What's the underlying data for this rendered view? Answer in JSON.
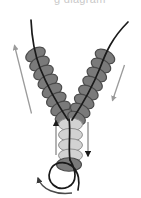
{
  "figure": {
    "title_partial": "g  diagram",
    "type": "bead-stringing-diagram",
    "background_color": "#ffffff"
  },
  "colors": {
    "bead_dark_fill": "#7a7a7a",
    "bead_dark_stroke": "#4a4a4a",
    "bead_light_fill": "#d2d2d2",
    "bead_light_stroke": "#8f8f8f",
    "thread_color": "#1a1a1a",
    "arrow_dark": "#1a1a1a",
    "arrow_gray": "#9a9a9a",
    "caption_color": "#c9c9c9"
  },
  "arms": {
    "left": {
      "label": "left-bead-arm",
      "bead_count": 8,
      "bead_style": "dark",
      "direction": "down-right"
    },
    "right": {
      "label": "right-bead-arm",
      "bead_count": 7,
      "bead_style": "dark",
      "direction": "down-left"
    }
  },
  "center_column": {
    "label": "center-bead-column",
    "light_bead_count": 4,
    "bottom_dark_bead_count": 1,
    "bead_style": "light"
  },
  "arrows": [
    {
      "name": "outer-left-arrow",
      "style": "straight",
      "color": "#9a9a9a",
      "points": "up-left"
    },
    {
      "name": "outer-right-arrow",
      "style": "straight",
      "color": "#9a9a9a",
      "points": "down-left"
    },
    {
      "name": "center-left-arrow",
      "style": "straight",
      "color": "#9a9a9a",
      "points": "up"
    },
    {
      "name": "center-right-arrow",
      "style": "straight",
      "color": "#1a1a1a",
      "points": "down"
    },
    {
      "name": "bottom-loop-arrow",
      "style": "curved",
      "color": "#4a4a4a",
      "points": "up-left"
    }
  ],
  "threads": {
    "left_tail": "exits top-left curving up-right",
    "right_tail": "exits top-right curving up-right",
    "bottom_loop": "open loop below center column"
  }
}
